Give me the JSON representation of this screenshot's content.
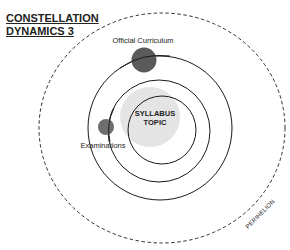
{
  "title": {
    "line1": "CONSTELLATION",
    "line2": "DYNAMICS 3"
  },
  "center": {
    "line1": "SYLLABUS",
    "line2": "TOPIC"
  },
  "bodies": [
    {
      "label": "Official Curriculum",
      "color": "#5c5c5c"
    },
    {
      "label": "Examinations",
      "color": "#6a6a6a"
    }
  ],
  "boundary": {
    "label": "PERIHELION",
    "style": "dashed"
  },
  "colors": {
    "line": "#1a1a1a",
    "core_glow": "#e2e2e2",
    "background": "#ffffff"
  }
}
